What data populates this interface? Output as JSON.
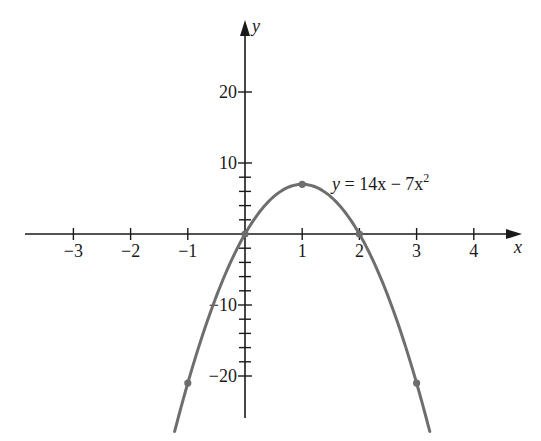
{
  "chart_data": {
    "type": "line",
    "title": "",
    "equation_label": "y = 14x − 7x²",
    "equation": {
      "lhs": "y",
      "rhs_a": "14x",
      "op": "−",
      "rhs_b": "7x",
      "exp": "2"
    },
    "xlabel": "x",
    "ylabel": "y",
    "xlim": [
      -3.8,
      4.8
    ],
    "ylim": [
      -26,
      32
    ],
    "x_ticks": [
      -3,
      -2,
      -1,
      1,
      2,
      3,
      4
    ],
    "x_tick_labels": [
      "−3",
      "−2",
      "−1",
      "1",
      "2",
      "3",
      "4"
    ],
    "y_ticks_labeled": [
      20,
      10,
      -10,
      -20
    ],
    "y_tick_labels": [
      "20",
      "10",
      "−10",
      "−20"
    ],
    "y_minor_ticks": [
      2,
      4,
      6,
      8,
      -2,
      -4,
      -6,
      -8,
      -12,
      -14,
      -16,
      -18
    ],
    "grid": false,
    "series": [
      {
        "name": "y = 14x − 7x²",
        "function": "14*x - 7*x^2",
        "x_range": [
          -1.23,
          3.23
        ],
        "color": "#6e6e6e"
      }
    ],
    "marked_points": [
      {
        "x": -1,
        "y": -21
      },
      {
        "x": 0,
        "y": 0
      },
      {
        "x": 1,
        "y": 7
      },
      {
        "x": 2,
        "y": 0
      },
      {
        "x": 3,
        "y": -21
      }
    ]
  }
}
